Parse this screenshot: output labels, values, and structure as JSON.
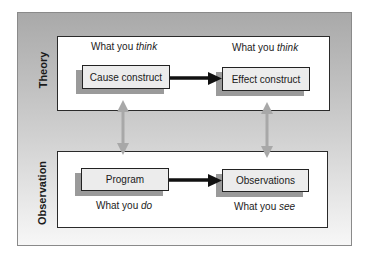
{
  "diagram": {
    "theory": {
      "label": "Theory",
      "left_caption": {
        "prefix": "What you ",
        "emphasis": "think"
      },
      "right_caption": {
        "prefix": "What you ",
        "emphasis": "think"
      },
      "cause_box": "Cause construct",
      "effect_box": "Effect construct"
    },
    "observation": {
      "label": "Observation",
      "left_caption": {
        "prefix": "What you ",
        "emphasis": "do"
      },
      "right_caption": {
        "prefix": "What you ",
        "emphasis": "see"
      },
      "program_box": "Program",
      "observations_box": "Observations"
    },
    "connectors": {
      "horizontal_arrows": [
        "cause-to-effect",
        "program-to-observations"
      ],
      "vertical_arrows": [
        "cause-program-link",
        "effect-observations-link"
      ]
    },
    "colors": {
      "frame_gradient_top": "#a9a9a9",
      "frame_gradient_bottom": "#f7f7f7",
      "panel_bg": "#ffffff",
      "box_bg": "#ececec",
      "box_shadow": "#9a9a9a",
      "horizontal_arrow": "#111111",
      "vertical_arrow": "#a8a8a8"
    }
  }
}
